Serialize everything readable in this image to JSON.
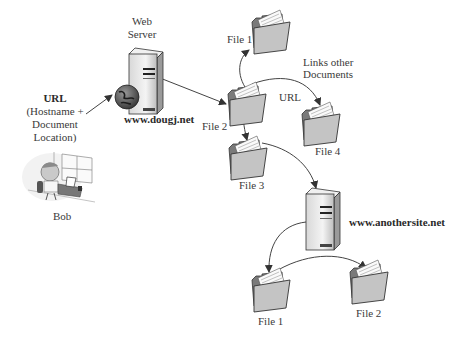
{
  "diagram": {
    "user": {
      "name": "Bob"
    },
    "url_note": {
      "title": "URL",
      "line1": "(Hostname +",
      "line2": "Document",
      "line3": "Location)"
    },
    "web_server": {
      "title_line1": "Web",
      "title_line2": "Server",
      "host": "www.dougj.net"
    },
    "links_note": {
      "line1": "Links other",
      "line2": "Documents"
    },
    "url_link_label": "URL",
    "site1_files": [
      "File 1",
      "File 2",
      "File 3",
      "File 4"
    ],
    "other_server": {
      "host": "www.anothersite.net"
    },
    "site2_files": [
      "File 1",
      "File 2"
    ]
  },
  "colors": {
    "folder_fill": "#bdbdbd",
    "folder_back": "#8a8a8a",
    "server_body": "#e6e6e6",
    "arrow": "#444444",
    "globe": "#555555"
  }
}
